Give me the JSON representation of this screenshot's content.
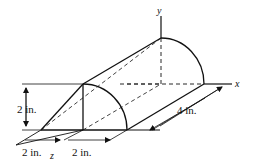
{
  "figure": {
    "axes": {
      "x_label": "x",
      "y_label": "y",
      "z_label": "z"
    },
    "dimensions": {
      "height": "2 in.",
      "length": "4 in.",
      "bottom_left": "2 in.",
      "bottom_right": "2 in."
    },
    "colors": {
      "line": "#111111",
      "background": "#ffffff"
    }
  }
}
